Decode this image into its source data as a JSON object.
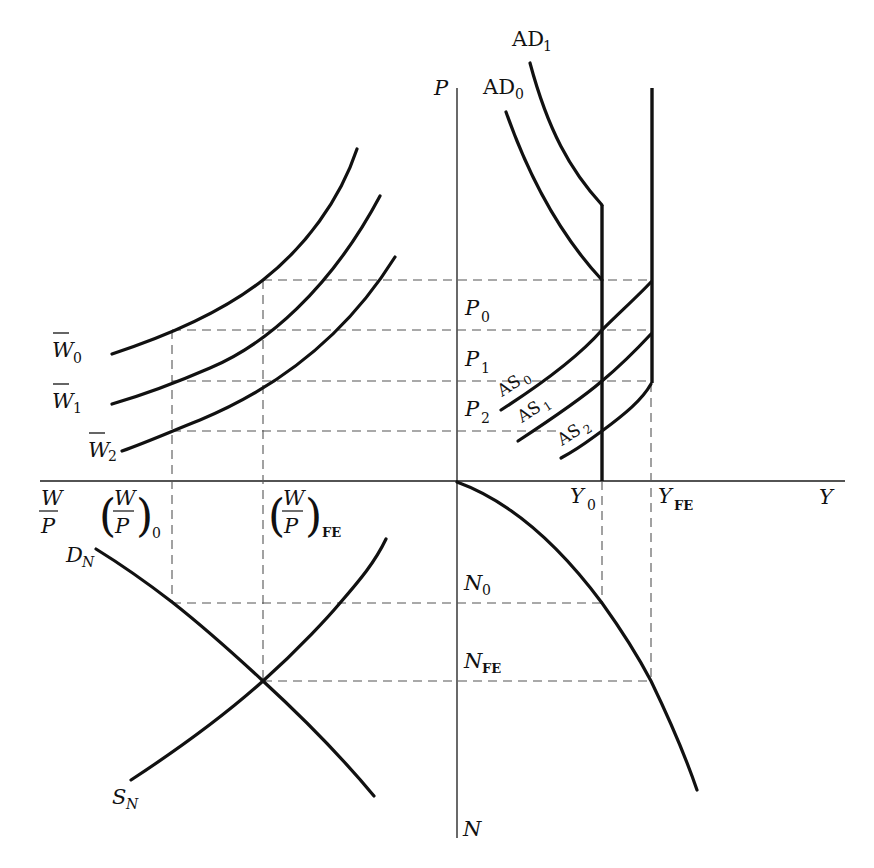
{
  "diagram": {
    "title": "",
    "colors": {
      "ink": "#111111",
      "dash": "#555555",
      "background": "#ffffff"
    },
    "axes": {
      "horizontal_left_label_num": "W",
      "horizontal_left_label_den": "P",
      "horizontal_right_label": "Y",
      "vertical_top_label": "P",
      "vertical_bottom_label": "N"
    },
    "upper_left": {
      "wage_curves": [
        {
          "label": "W",
          "sub": "0"
        },
        {
          "label": "W",
          "sub": "1"
        },
        {
          "label": "W",
          "sub": "2"
        }
      ]
    },
    "upper_right": {
      "ad_curves": [
        {
          "label": "AD",
          "sub": "0"
        },
        {
          "label": "AD",
          "sub": "1"
        }
      ],
      "as_curves": [
        {
          "label": "AS",
          "sub": "0"
        },
        {
          "label": "AS",
          "sub": "1"
        },
        {
          "label": "AS",
          "sub": "2"
        }
      ],
      "price_levels": [
        {
          "label": "P",
          "sub": "0"
        },
        {
          "label": "P",
          "sub": "1"
        },
        {
          "label": "P",
          "sub": "2"
        }
      ]
    },
    "horizontal_axis_ticks": {
      "real_wage_0": {
        "num": "W",
        "den": "P",
        "sub": "0"
      },
      "real_wage_fe": {
        "num": "W",
        "den": "P",
        "sub": "FE"
      },
      "output_0": {
        "label": "Y",
        "sub": "0"
      },
      "output_fe": {
        "label": "Y",
        "sub": "FE"
      }
    },
    "lower_left": {
      "demand": {
        "label": "D",
        "sub": "N"
      },
      "supply": {
        "label": "S",
        "sub": "N"
      }
    },
    "lower_right": {
      "employment_levels": [
        {
          "label": "N",
          "sub": "0"
        },
        {
          "label": "N",
          "sub": "FE"
        }
      ]
    }
  }
}
